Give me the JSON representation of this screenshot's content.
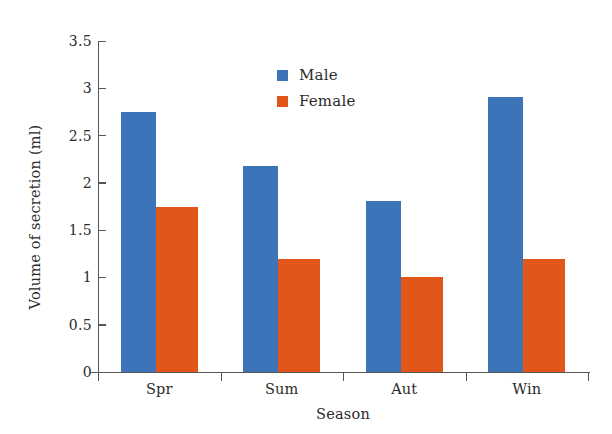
{
  "chart_data": {
    "type": "bar",
    "title": "",
    "xlabel": "Season",
    "ylabel": "Volume of secretion (ml)",
    "categories": [
      "Spr",
      "Sum",
      "Aut",
      "Win"
    ],
    "series": [
      {
        "name": "Male",
        "color": "#3d73b8",
        "values": [
          2.75,
          2.18,
          1.81,
          2.91
        ]
      },
      {
        "name": "Female",
        "color": "#e2561a",
        "values": [
          1.75,
          1.2,
          1.0,
          1.2
        ]
      }
    ],
    "ylim": [
      0,
      3.5
    ],
    "yticks": [
      0,
      0.5,
      1,
      1.5,
      2,
      2.5,
      3,
      3.5
    ],
    "ytick_labels": [
      "0",
      "0.5",
      "1",
      "1.5",
      "2",
      "2.5",
      "3",
      "3.5"
    ],
    "grid": false,
    "legend_position": "upper center",
    "legend_entries": [
      "Male",
      "Female"
    ]
  },
  "axes": {
    "y_title": "Volume of secretion (ml)",
    "x_title": "Season",
    "y_labels": [
      "3.5",
      "3",
      "2.5",
      "2",
      "1.5",
      "1",
      "0.5",
      "0"
    ],
    "x_labels": [
      "Spr",
      "Sum",
      "Aut",
      "Win"
    ]
  },
  "legend": {
    "items": [
      {
        "label": "Male",
        "color": "#3d73b8"
      },
      {
        "label": "Female",
        "color": "#e2561a"
      }
    ]
  }
}
